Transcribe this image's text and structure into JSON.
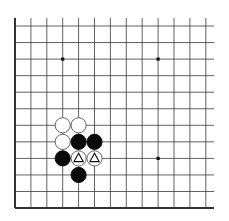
{
  "board": {
    "description": "Go board diagram, bottom-left corner region",
    "line_color": "#3a3a3a",
    "edge_color": "#333333",
    "background": "#ffffff",
    "columns": 13,
    "rows": 12,
    "grid_left": 15,
    "grid_top": 26,
    "col_spacing": 15.9,
    "row_spacing": 16.55,
    "right_extent": 214,
    "top_extent": 18,
    "edges": {
      "left": true,
      "bottom": true,
      "top": false,
      "right": false
    },
    "star_points": [
      {
        "col": 3,
        "row": 2
      },
      {
        "col": 9,
        "row": 2
      },
      {
        "col": 9,
        "row": 8
      }
    ]
  },
  "stones": [
    {
      "color": "white",
      "col": 3,
      "row": 6,
      "marker": ""
    },
    {
      "color": "white",
      "col": 4,
      "row": 6,
      "marker": ""
    },
    {
      "color": "white",
      "col": 3,
      "row": 7,
      "marker": ""
    },
    {
      "color": "black",
      "col": 4,
      "row": 7,
      "marker": ""
    },
    {
      "color": "black",
      "col": 5,
      "row": 7,
      "marker": ""
    },
    {
      "color": "black",
      "col": 3,
      "row": 8,
      "marker": ""
    },
    {
      "color": "white",
      "col": 4,
      "row": 8,
      "marker": "triangle"
    },
    {
      "color": "white",
      "col": 5,
      "row": 8,
      "marker": "triangle"
    },
    {
      "color": "black",
      "col": 4,
      "row": 9,
      "marker": ""
    }
  ]
}
